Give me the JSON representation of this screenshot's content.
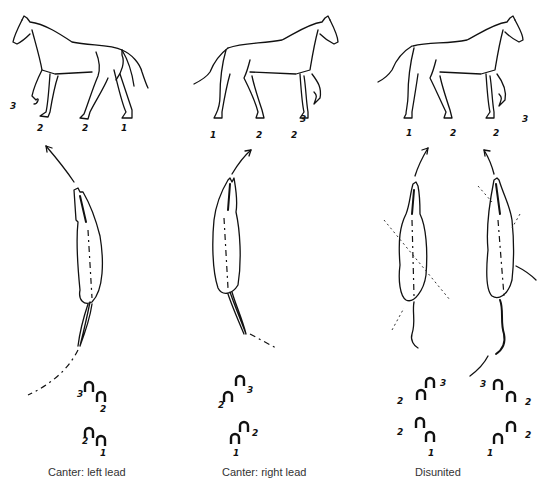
{
  "figure": {
    "panels": [
      {
        "id": "left-lead",
        "caption": "Canter: left lead",
        "side_view_leg_labels": [
          "3",
          "2",
          "2",
          "1"
        ],
        "hoofprint_labels": [
          "3",
          "2",
          "2",
          "1"
        ]
      },
      {
        "id": "right-lead",
        "caption": "Canter: right lead",
        "side_view_leg_labels": [
          "1",
          "2",
          "2",
          "3"
        ],
        "hoofprint_labels": [
          "3",
          "2",
          "2",
          "1"
        ]
      },
      {
        "id": "disunited",
        "caption": "Disunited",
        "side_view_leg_labels": [
          "1",
          "2",
          "2",
          "3"
        ],
        "hoofprint_labels_left": [
          "3",
          "2",
          "2",
          "1"
        ],
        "hoofprint_labels_right": [
          "3",
          "2",
          "2",
          "1"
        ]
      }
    ],
    "colors": {
      "ink": "#111111",
      "caption": "#333333",
      "background": "#ffffff"
    }
  }
}
